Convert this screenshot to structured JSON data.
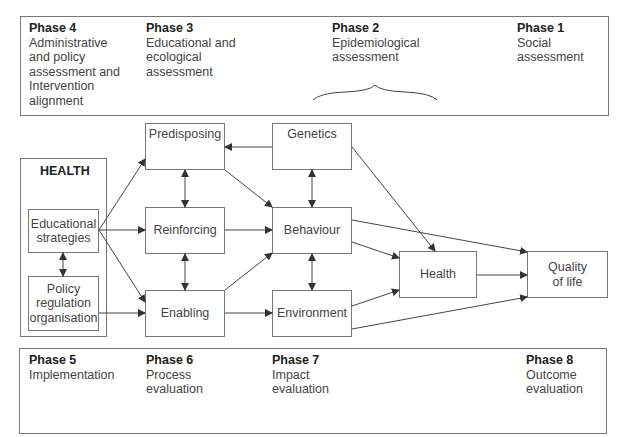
{
  "top_phases": [
    {
      "title": "Phase 4",
      "text": [
        "Administrative",
        "and policy",
        "assessment and",
        "Intervention",
        "alignment"
      ]
    },
    {
      "title": "Phase 3",
      "text": [
        "Educational and",
        "ecological",
        "assessment"
      ]
    },
    {
      "title": "Phase 2",
      "text": [
        "Epidemiological",
        "assessment"
      ]
    },
    {
      "title": "Phase 1",
      "text": [
        "Social",
        "assessment"
      ]
    }
  ],
  "bottom_phases": [
    {
      "title": "Phase 5",
      "text": [
        "Implementation"
      ]
    },
    {
      "title": "Phase 6",
      "text": [
        "Process",
        "evaluation"
      ]
    },
    {
      "title": "Phase 7",
      "text": [
        "Impact",
        "evaluation"
      ]
    },
    {
      "title": "Phase 8",
      "text": [
        "Outcome",
        "evaluation"
      ]
    }
  ],
  "health_group": {
    "label": "HEALTH",
    "educational": [
      "Educational",
      "strategies"
    ],
    "policy": [
      "Policy",
      "regulation",
      "organisation"
    ]
  },
  "nodes": {
    "predisposing": "Predisposing",
    "reinforcing": "Reinforcing",
    "enabling": "Enabling",
    "genetics": "Genetics",
    "behaviour": "Behaviour",
    "environment": "Environment",
    "health": "Health",
    "quality": [
      "Quality",
      "of life"
    ]
  }
}
